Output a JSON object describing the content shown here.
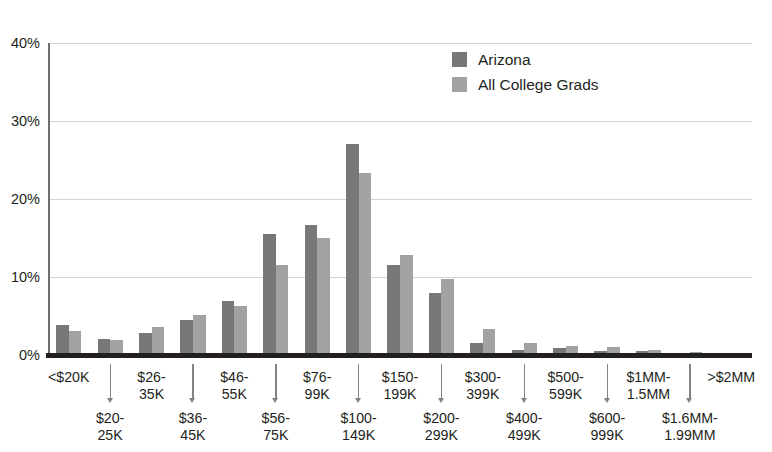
{
  "chart_data": {
    "type": "bar",
    "title": "",
    "xlabel": "",
    "ylabel": "",
    "ylim": [
      0,
      40
    ],
    "y_ticks": [
      "0%",
      "10%",
      "20%",
      "30%",
      "40%"
    ],
    "y_tick_values": [
      0,
      10,
      20,
      30,
      40
    ],
    "grid": true,
    "legend_position": "top-right",
    "categories": [
      "<$20K",
      "$20-25K",
      "$26-35K",
      "$36-45K",
      "$46-55K",
      "$56-75K",
      "$76-99K",
      "$100-149K",
      "$150-199K",
      "$200-299K",
      "$300-399K",
      "$400-499K",
      "$500-599K",
      "$600-999K",
      "$1MM-1.5MM",
      "$1.6MM-1.99MM",
      ">$2MM"
    ],
    "category_lines": [
      [
        "<$20K"
      ],
      [
        "$20-",
        "25K"
      ],
      [
        "$26-",
        "35K"
      ],
      [
        "$36-",
        "45K"
      ],
      [
        "$46-",
        "55K"
      ],
      [
        "$56-",
        "75K"
      ],
      [
        "$76-",
        "99K"
      ],
      [
        "$100-",
        "149K"
      ],
      [
        "$150-",
        "199K"
      ],
      [
        "$200-",
        "299K"
      ],
      [
        "$300-",
        "399K"
      ],
      [
        "$400-",
        "499K"
      ],
      [
        "$500-",
        "599K"
      ],
      [
        "$600-",
        "999K"
      ],
      [
        "$1MM-",
        "1.5MM"
      ],
      [
        "$1.6MM-",
        "1.99MM"
      ],
      [
        ">$2MM"
      ]
    ],
    "series": [
      {
        "name": "Arizona",
        "color": "#77787a",
        "values": [
          3.9,
          2.1,
          2.8,
          4.5,
          6.9,
          15.5,
          16.7,
          27.0,
          11.5,
          8.0,
          1.5,
          0.7,
          0.9,
          0.5,
          0.5,
          0.3,
          0.2
        ]
      },
      {
        "name": "All College Grads",
        "color": "#a1a2a4",
        "values": [
          3.1,
          1.9,
          3.6,
          5.1,
          6.3,
          11.5,
          15.0,
          23.3,
          12.8,
          9.8,
          3.3,
          1.5,
          1.1,
          1.0,
          0.7,
          0.4,
          0.3
        ]
      }
    ]
  },
  "legend": {
    "items": [
      {
        "label": "Arizona",
        "color": "#77787a"
      },
      {
        "label": "All College Grads",
        "color": "#a1a2a4"
      }
    ]
  },
  "colors": {
    "series_dark": "#77787a",
    "series_light": "#a1a2a4",
    "axis": "#231f20",
    "gridline": "#d4d4d4",
    "text": "#231f20"
  }
}
